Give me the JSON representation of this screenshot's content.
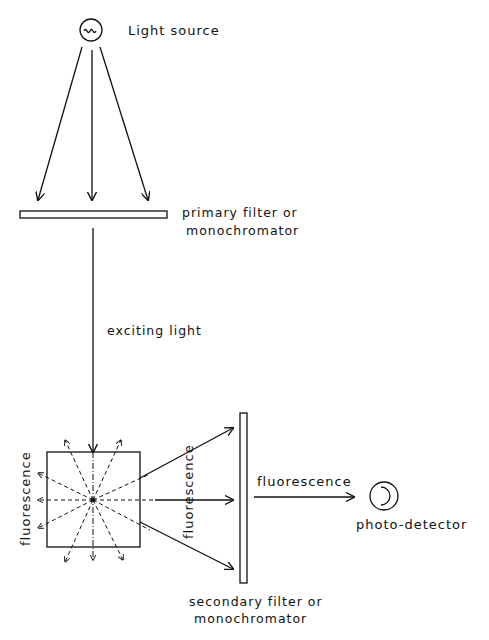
{
  "diagram": {
    "type": "fluorescence-measurement-schematic",
    "labels": {
      "light_source": "Light source",
      "primary_filter_line1": "primary filter or",
      "primary_filter_line2": "monochromator",
      "exciting_light": "exciting light",
      "fluorescence_left": "fluorescence",
      "fluorescence_mid": "fluorescence",
      "fluorescence_right": "fluorescence",
      "photo_detector": "photo-detector",
      "secondary_filter_line1": "secondary filter or",
      "secondary_filter_line2": "monochromator"
    },
    "components": [
      {
        "id": "light-source",
        "shape": "circle-with-wave",
        "label_ref": "light_source"
      },
      {
        "id": "primary-filter",
        "shape": "horizontal-bar",
        "label_ref": "primary_filter"
      },
      {
        "id": "sample-cuvette",
        "shape": "square"
      },
      {
        "id": "secondary-filter",
        "shape": "vertical-bar",
        "label_ref": "secondary_filter"
      },
      {
        "id": "photo-detector",
        "shape": "circle-with-arc",
        "label_ref": "photo_detector"
      }
    ],
    "colors": {
      "ink": "#111111",
      "background": "#ffffff"
    }
  }
}
